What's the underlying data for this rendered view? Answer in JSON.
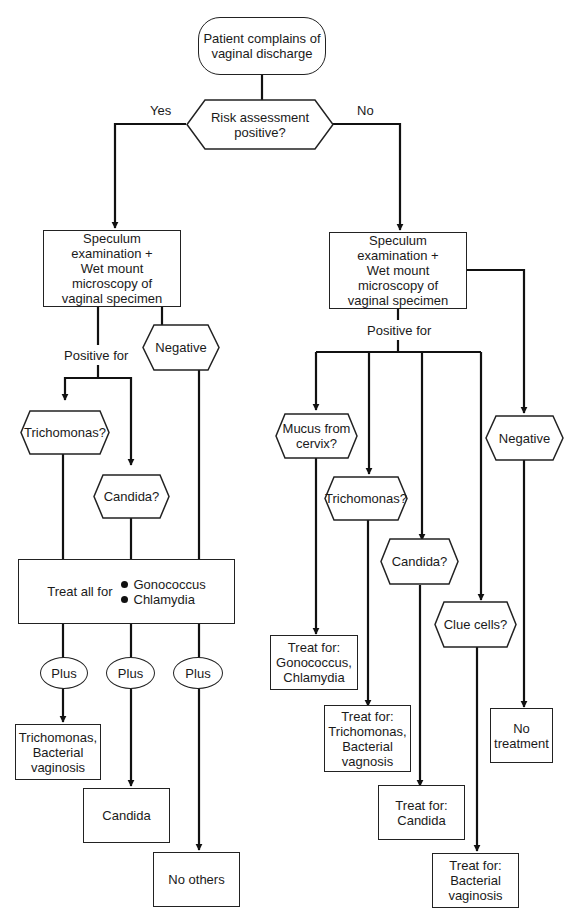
{
  "diagram": {
    "start": {
      "text": "Patient complains of\nvaginal discharge"
    },
    "decision_risk": {
      "text": "Risk assessment\npositive?"
    },
    "edge_labels": {
      "yes": "Yes",
      "no": "No"
    },
    "left": {
      "exam": {
        "text": "Speculum\nexamination +\nWet mount\nmicroscopy of\nvaginal specimen"
      },
      "positive_for": "Positive for",
      "negative": {
        "text": "Negative"
      },
      "trichomonas": {
        "text": "Trichomonas?"
      },
      "candida": {
        "text": "Candida?"
      },
      "treat_all": {
        "prefix": "Treat all for",
        "items": [
          "Gonococcus",
          "Chlamydia"
        ]
      },
      "plus": [
        "Plus",
        "Plus",
        "Plus"
      ],
      "outcomes": [
        {
          "text": "Trichomonas,\nBacterial\nvaginosis"
        },
        {
          "text": "Candida"
        },
        {
          "text": "No others"
        }
      ]
    },
    "right": {
      "exam": {
        "text": "Speculum\nexamination +\nWet mount\nmicroscopy of\nvaginal specimen"
      },
      "positive_for": "Positive for",
      "negative": {
        "text": "Negative"
      },
      "mucus": {
        "text": "Mucus from\ncervix?"
      },
      "trichomonas": {
        "text": "Trichomonas?"
      },
      "candida": {
        "text": "Candida?"
      },
      "clue_cells": {
        "text": "Clue cells?"
      },
      "outcomes": [
        {
          "text": "Treat for:\nGonococcus,\nChlamydia"
        },
        {
          "text": "Treat for:\nTrichomonas,\nBacterial\nvagnosis"
        },
        {
          "text": "Treat for:\nCandida"
        },
        {
          "text": "Treat for:\nBacterial\nvaginosis"
        },
        {
          "text": "No\ntreatment"
        }
      ]
    }
  }
}
